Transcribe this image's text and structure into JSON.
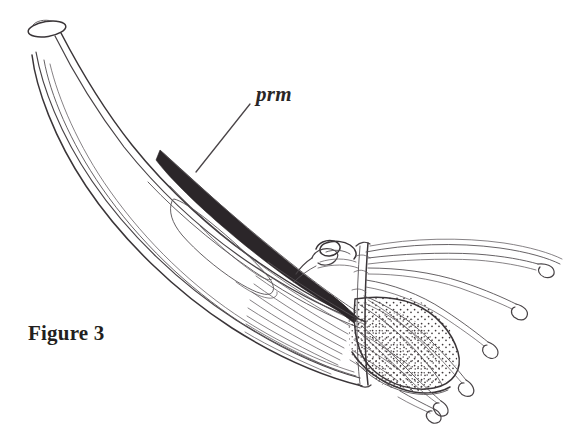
{
  "figure": {
    "caption": "Figure 3",
    "callout_label": "prm",
    "background_color": "#ffffff",
    "ink_color": "#3a3538",
    "fill_color": "#2b2629",
    "width": 581,
    "height": 428,
    "style": "black-and-white scientific line drawing with stippling and hatching"
  },
  "annotations": [
    {
      "id": "prm",
      "label": "prm",
      "meaning": "labelled internal dark tapering structure",
      "text_x": 256,
      "text_y": 100,
      "leader_from_x": 250,
      "leader_from_y": 104,
      "leader_to_x": 196,
      "leader_to_y": 172
    },
    {
      "id": "caption",
      "label": "Figure 3",
      "text_x": 28,
      "text_y": 340
    }
  ],
  "parts": [
    {
      "name": "apical-opening",
      "description": "small open ellipse at upper-left tip of sheath"
    },
    {
      "name": "sheath-outline",
      "description": "long curved tapering tube descending to lower right"
    },
    {
      "name": "prm-structure",
      "description": "solid black tapering wedge inside sheath"
    },
    {
      "name": "inner-sac",
      "description": "elongated teardrop outline within sheath midsection"
    },
    {
      "name": "hook-structure",
      "description": "zigzag S-shaped hook near centre right"
    },
    {
      "name": "cut-edge",
      "description": "vertical sectioned edge crossing the lobe"
    },
    {
      "name": "stippled-lobe",
      "description": "rounded lobe with dotted stipple shading"
    },
    {
      "name": "muscle-striations",
      "description": "fine parallel fibre lines converging into lobe"
    },
    {
      "name": "filaments",
      "description": "six long filaments fanning right ending in teardrop loops"
    }
  ]
}
